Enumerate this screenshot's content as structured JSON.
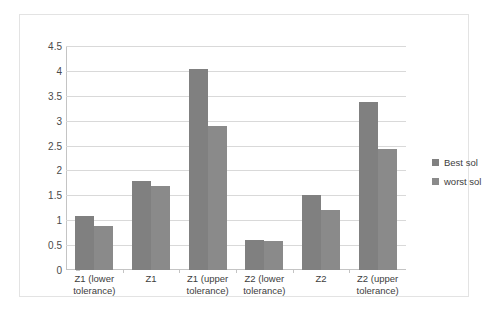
{
  "chart_data": {
    "type": "bar",
    "title": "",
    "xlabel": "",
    "ylabel": "",
    "ylim": [
      0,
      4.5
    ],
    "ytick_labels": [
      "0",
      "0.5",
      "1",
      "1.5",
      "2",
      "2.5",
      "3",
      "3.5",
      "4",
      "4.5"
    ],
    "ytick_values": [
      0,
      0.5,
      1,
      1.5,
      2,
      2.5,
      3,
      3.5,
      4,
      4.5
    ],
    "grid": true,
    "legend_position": "right",
    "categories": [
      "Z1 (lower\ntolerance)",
      "Z1",
      "Z1 (upper\ntolerance)",
      "Z2 (lower\ntolerance)",
      "Z2",
      "Z2 (upper\ntolerance)"
    ],
    "series": [
      {
        "name": "Best sol",
        "color": "#808080",
        "values": [
          1.08,
          1.78,
          4.03,
          0.6,
          1.51,
          3.38
        ]
      },
      {
        "name": "worst sol",
        "color": "#8a8a8a",
        "values": [
          0.88,
          1.68,
          2.89,
          0.59,
          1.2,
          2.43
        ]
      }
    ]
  }
}
